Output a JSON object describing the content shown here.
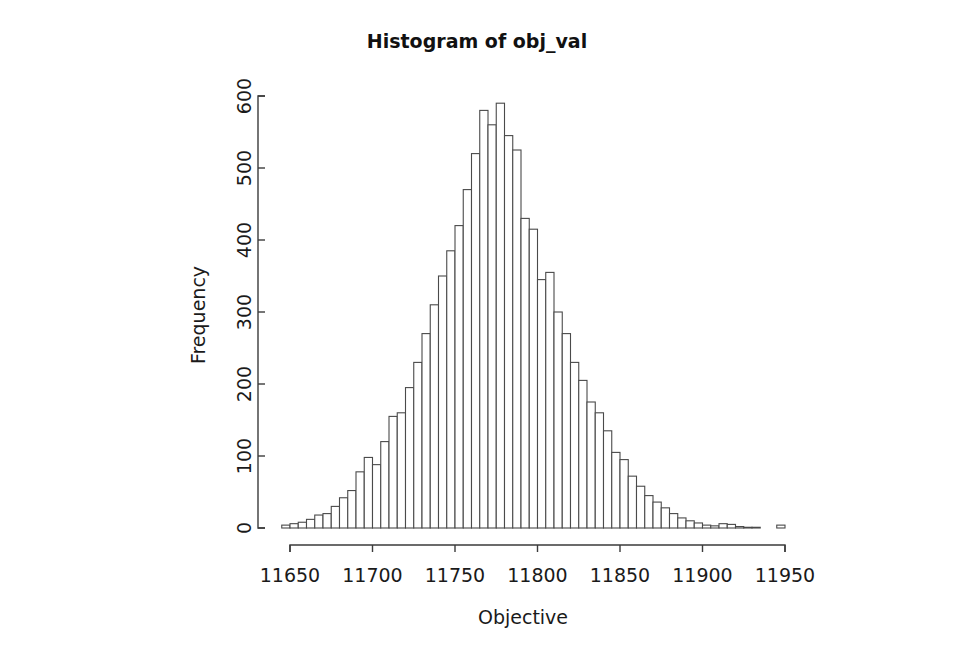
{
  "figure": {
    "title": "Histogram of obj_val",
    "background_color": "#ffffff",
    "bar_fill_color": "#ffffff",
    "bar_border_color": "#4a4a4a",
    "axis_color": "#3b3b3b"
  },
  "axes": {
    "x_label": "Objective",
    "y_label": "Frequency",
    "x_ticks": [
      "11650",
      "11700",
      "11750",
      "11800",
      "11850",
      "11900",
      "11950"
    ],
    "y_ticks": [
      "0",
      "100",
      "200",
      "300",
      "400",
      "500",
      "600"
    ]
  },
  "chart_data": {
    "type": "bar",
    "title": "Histogram of obj_val",
    "xlabel": "Objective",
    "ylabel": "Frequency",
    "xlim": [
      11645,
      11955
    ],
    "ylim": [
      0,
      620
    ],
    "grid": false,
    "legend": null,
    "bin_width": 5,
    "bin_starts": [
      11645,
      11650,
      11655,
      11660,
      11665,
      11670,
      11675,
      11680,
      11685,
      11690,
      11695,
      11700,
      11705,
      11710,
      11715,
      11720,
      11725,
      11730,
      11735,
      11740,
      11745,
      11750,
      11755,
      11760,
      11765,
      11770,
      11775,
      11780,
      11785,
      11790,
      11795,
      11800,
      11805,
      11810,
      11815,
      11820,
      11825,
      11830,
      11835,
      11840,
      11845,
      11850,
      11855,
      11860,
      11865,
      11870,
      11875,
      11880,
      11885,
      11890,
      11895,
      11900,
      11905,
      11910,
      11915,
      11920,
      11925,
      11930,
      11935,
      11940,
      11945
    ],
    "categories": [
      "11645-11650",
      "11650-11655",
      "11655-11660",
      "11660-11665",
      "11665-11670",
      "11670-11675",
      "11675-11680",
      "11680-11685",
      "11685-11690",
      "11690-11695",
      "11695-11700",
      "11700-11705",
      "11705-11710",
      "11710-11715",
      "11715-11720",
      "11720-11725",
      "11725-11730",
      "11730-11735",
      "11735-11740",
      "11740-11745",
      "11745-11750",
      "11750-11755",
      "11755-11760",
      "11760-11765",
      "11765-11770",
      "11770-11775",
      "11775-11780",
      "11780-11785",
      "11785-11790",
      "11790-11795",
      "11795-11800",
      "11800-11805",
      "11805-11810",
      "11810-11815",
      "11815-11820",
      "11820-11825",
      "11825-11830",
      "11830-11835",
      "11835-11840",
      "11840-11845",
      "11845-11850",
      "11850-11855",
      "11855-11860",
      "11860-11865",
      "11865-11870",
      "11870-11875",
      "11875-11880",
      "11880-11885",
      "11885-11890",
      "11890-11895",
      "11895-11900",
      "11900-11905",
      "11905-11910",
      "11910-11915",
      "11915-11920",
      "11920-11925",
      "11925-11930",
      "11930-11935",
      "11935-11940",
      "11940-11945",
      "11945-11950"
    ],
    "values": [
      4,
      6,
      8,
      12,
      18,
      20,
      30,
      42,
      52,
      78,
      98,
      88,
      120,
      155,
      160,
      195,
      230,
      270,
      310,
      350,
      385,
      420,
      470,
      520,
      580,
      560,
      590,
      545,
      525,
      430,
      415,
      345,
      355,
      300,
      270,
      230,
      205,
      175,
      160,
      135,
      105,
      95,
      72,
      58,
      45,
      36,
      28,
      20,
      14,
      10,
      7,
      4,
      3,
      6,
      5,
      2,
      1,
      1,
      0,
      0,
      4
    ],
    "peak_value": 590,
    "peak_bin": "11775-11780"
  }
}
